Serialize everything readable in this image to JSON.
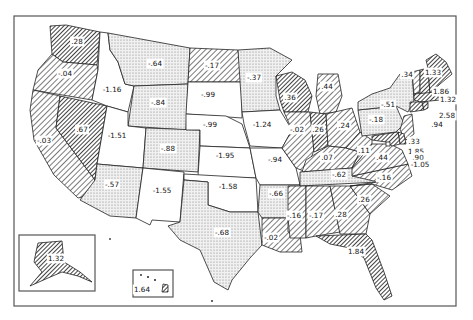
{
  "map": {
    "title": "",
    "legend_patterns": {
      "blank": "white (strongly negative, ≤ -0.9)",
      "dots": "stippled (moderately negative)",
      "hatch": "light diagonal hatch (near zero / small positive)",
      "dense": "dense diagonal hatch (strongly positive, ≥ 1.3)"
    },
    "states": [
      {
        "id": "WA",
        "value": ".28",
        "pattern": "dense"
      },
      {
        "id": "OR",
        "value": "-.04",
        "pattern": "hatch"
      },
      {
        "id": "CA",
        "value": "-.03",
        "pattern": "hatch"
      },
      {
        "id": "NV",
        "value": ".67",
        "pattern": "dense"
      },
      {
        "id": "ID",
        "value": "-1.16",
        "pattern": "blank"
      },
      {
        "id": "MT",
        "value": "-.64",
        "pattern": "dots"
      },
      {
        "id": "WY",
        "value": "-.84",
        "pattern": "dots"
      },
      {
        "id": "UT",
        "value": "-1.51",
        "pattern": "blank"
      },
      {
        "id": "AZ",
        "value": "-.57",
        "pattern": "dots"
      },
      {
        "id": "CO",
        "value": "-.88",
        "pattern": "dots"
      },
      {
        "id": "NM",
        "value": "-1.55",
        "pattern": "blank"
      },
      {
        "id": "ND",
        "value": "-.17",
        "pattern": "hatch"
      },
      {
        "id": "SD",
        "value": "-.99",
        "pattern": "blank"
      },
      {
        "id": "NE",
        "value": "-.99",
        "pattern": "blank"
      },
      {
        "id": "KS",
        "value": "-1.95",
        "pattern": "blank"
      },
      {
        "id": "OK",
        "value": "-1.58",
        "pattern": "blank"
      },
      {
        "id": "TX",
        "value": "-.68",
        "pattern": "dots"
      },
      {
        "id": "MN",
        "value": "-.37",
        "pattern": "dots"
      },
      {
        "id": "IA",
        "value": "-1.24",
        "pattern": "blank"
      },
      {
        "id": "MO",
        "value": "-.94",
        "pattern": "blank"
      },
      {
        "id": "AR",
        "value": "-.66",
        "pattern": "dots"
      },
      {
        "id": "LA",
        "value": "-.02",
        "pattern": "hatch"
      },
      {
        "id": "WI",
        "value": ".36",
        "pattern": "dense"
      },
      {
        "id": "IL",
        "value": "-.02",
        "pattern": "hatch"
      },
      {
        "id": "MI",
        "value": ".44",
        "pattern": "hatch"
      },
      {
        "id": "IN",
        "value": ".26",
        "pattern": "dense"
      },
      {
        "id": "OH",
        "value": ".24",
        "pattern": "hatch"
      },
      {
        "id": "KY",
        "value": ".07",
        "pattern": "hatch"
      },
      {
        "id": "TN",
        "value": "-.62",
        "pattern": "dots"
      },
      {
        "id": "MS",
        "value": "-.16",
        "pattern": "hatch"
      },
      {
        "id": "AL",
        "value": "-.17",
        "pattern": "hatch"
      },
      {
        "id": "GA",
        "value": ".28",
        "pattern": "hatch"
      },
      {
        "id": "FL",
        "value": "1.84",
        "pattern": "dense"
      },
      {
        "id": "SC",
        "value": ".26",
        "pattern": "hatch"
      },
      {
        "id": "NC",
        "value": "-.16",
        "pattern": "hatch"
      },
      {
        "id": "VA",
        "value": ".44",
        "pattern": "hatch"
      },
      {
        "id": "WV",
        "value": ".11",
        "pattern": "hatch"
      },
      {
        "id": "PA",
        "value": "-.18",
        "pattern": "dots"
      },
      {
        "id": "NY",
        "value": "-.51",
        "pattern": "dots"
      },
      {
        "id": "VT",
        "value": ".34",
        "pattern": "hatch"
      },
      {
        "id": "ME",
        "value": "1.33",
        "pattern": "dense"
      },
      {
        "id": "NH",
        "value": "1.86",
        "pattern": "dense"
      },
      {
        "id": "MA",
        "value": "1.32",
        "pattern": "dense"
      },
      {
        "id": "RI",
        "value": "2.58",
        "pattern": "dense"
      },
      {
        "id": "CT",
        "value": ".94",
        "pattern": "dense"
      },
      {
        "id": "NJ",
        "value": ".33",
        "pattern": "hatch"
      },
      {
        "id": "DE",
        "value": "1.85",
        "pattern": "dense"
      },
      {
        "id": "MD",
        "value": ".90",
        "pattern": "dense"
      },
      {
        "id": "DC",
        "value": "-1.05",
        "pattern": "blank"
      },
      {
        "id": "AK",
        "value": "1.32",
        "pattern": "dense"
      },
      {
        "id": "HI",
        "value": "1.64",
        "pattern": "dense"
      }
    ]
  }
}
